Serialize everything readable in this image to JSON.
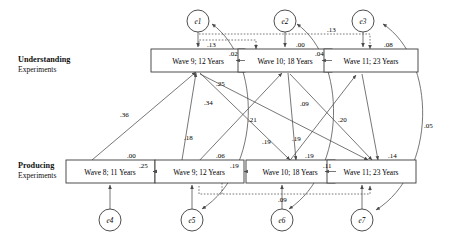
{
  "figure": {
    "type": "path-diagram",
    "groups": [
      {
        "id": "understanding",
        "title": "Understanding",
        "subtitle": "Experiments"
      },
      {
        "id": "producing",
        "title": "Producing",
        "subtitle": "Experiments"
      }
    ],
    "boxes": [
      {
        "id": "u9",
        "label": "Wave 9; 12 Years",
        "row": "understanding"
      },
      {
        "id": "u10",
        "label": "Wave 10; 18 Years",
        "row": "understanding"
      },
      {
        "id": "u11",
        "label": "Wave 11; 23 Years",
        "row": "understanding"
      },
      {
        "id": "p8",
        "label": "Wave 8; 11 Years",
        "row": "producing"
      },
      {
        "id": "p9",
        "label": "Wave 9; 12 Years",
        "row": "producing"
      },
      {
        "id": "p10",
        "label": "Wave 10; 18 Years",
        "row": "producing"
      },
      {
        "id": "p11",
        "label": "Wave 11; 23 Years",
        "row": "producing"
      }
    ],
    "errors": [
      {
        "id": "e1",
        "label": "e1",
        "target": "u9"
      },
      {
        "id": "e2",
        "label": "e2",
        "target": "u10"
      },
      {
        "id": "e3",
        "label": "e3",
        "target": "u11"
      },
      {
        "id": "e4",
        "label": "e4",
        "target": "p8"
      },
      {
        "id": "e5",
        "label": "e5",
        "target": "p9"
      },
      {
        "id": "e6",
        "label": "e6",
        "target": "p10"
      },
      {
        "id": "e7",
        "label": "e7",
        "target": "p11"
      }
    ],
    "coefficients": [
      {
        "id": "c-u9-var",
        "value": ".13",
        "from": "u9-dashed",
        "to": "u9",
        "style": "dashed"
      },
      {
        "id": "c-u9-u10",
        "value": ".02",
        "from": "u9",
        "to": "u10",
        "style": "solid"
      },
      {
        "id": "c-u10-var",
        "value": ".00",
        "from": "e2",
        "to": "u10",
        "style": "solid"
      },
      {
        "id": "c-u10-u11",
        "value": ".04",
        "from": "u10",
        "to": "u11",
        "style": "solid"
      },
      {
        "id": "c-u9-u11-dash",
        "value": ".13",
        "from": "u9",
        "to": "u11",
        "style": "dashed"
      },
      {
        "id": "c-u11-var",
        "value": ".08",
        "from": "e3",
        "to": "u11",
        "style": "solid"
      },
      {
        "id": "c-p8-var",
        "value": ".00",
        "from": "e4",
        "to": "p8",
        "style": "solid"
      },
      {
        "id": "c-p8-p9",
        "value": ".25",
        "from": "p8",
        "to": "p9",
        "style": "solid"
      },
      {
        "id": "c-p9-var",
        "value": ".06",
        "from": "e5",
        "to": "p9",
        "style": "solid"
      },
      {
        "id": "c-p9-p10",
        "value": ".19",
        "from": "p9",
        "to": "p10",
        "style": "solid"
      },
      {
        "id": "c-p10-var",
        "value": ".19",
        "from": "e6",
        "to": "p10",
        "style": "solid"
      },
      {
        "id": "c-p10-p11",
        "value": ".11",
        "from": "p10",
        "to": "p11",
        "style": "solid"
      },
      {
        "id": "c-p11-var",
        "value": ".14",
        "from": "e7",
        "to": "p11",
        "style": "solid"
      },
      {
        "id": "c-p9-p11-dash",
        "value": ".09",
        "from": "p9",
        "to": "p11",
        "style": "dashed"
      },
      {
        "id": "c-p8-u9",
        "value": ".36",
        "from": "p8",
        "to": "u9",
        "style": "solid"
      },
      {
        "id": "c-u9-p10",
        "value": ".25",
        "from": "u9",
        "to": "p10",
        "style": "solid"
      },
      {
        "id": "c-u9-p11",
        "value": ".34",
        "from": "u9",
        "to": "p11",
        "style": "solid"
      },
      {
        "id": "c-p9-u9",
        "value": ".18",
        "from": "p9",
        "to": "u9",
        "style": "solid"
      },
      {
        "id": "c-p9-u10",
        "value": ".21",
        "from": "p9",
        "to": "u10",
        "style": "solid"
      },
      {
        "id": "c-u10-p11",
        "value": ".09",
        "from": "u10",
        "to": "p11",
        "style": "solid"
      },
      {
        "id": "c-p10-u11",
        "value": ".19",
        "from": "p10",
        "to": "u11",
        "style": "solid"
      },
      {
        "id": "c-u10-p10",
        "value": ".19",
        "from": "u10",
        "to": "p10",
        "style": "solid"
      },
      {
        "id": "c-u11-p11",
        "value": ".20",
        "from": "u11",
        "to": "p11",
        "style": "solid"
      },
      {
        "id": "c-e1-e5",
        "value": "",
        "from": "e1",
        "to": "e5",
        "style": "curve"
      },
      {
        "id": "c-e2-e6",
        "value": "",
        "from": "e2",
        "to": "e6",
        "style": "curve"
      },
      {
        "id": "c-e3-e7",
        "value": ".05",
        "from": "e3",
        "to": "e7",
        "style": "curve"
      }
    ]
  }
}
